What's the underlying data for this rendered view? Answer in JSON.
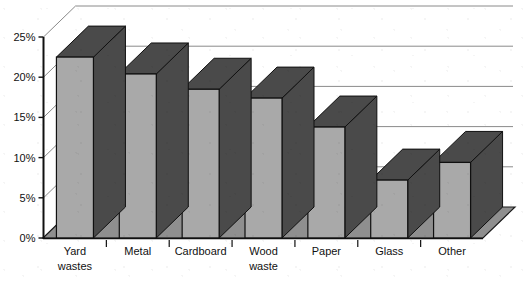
{
  "chart_data": {
    "type": "bar",
    "title": "",
    "subtitle": "",
    "xlabel": "",
    "ylabel": "",
    "categories": [
      "Yard wastes",
      "Metal",
      "Cardboard",
      "Wood waste",
      "Paper",
      "Glass",
      "Other"
    ],
    "values": [
      22.5,
      20.4,
      18.5,
      17.4,
      13.8,
      7.2,
      9.4
    ],
    "ylim": [
      0,
      25
    ],
    "y_ticks": [
      0,
      5,
      10,
      15,
      20,
      25
    ],
    "y_tick_labels": [
      "0%",
      "5%",
      "10%",
      "15%",
      "20%",
      "25%"
    ],
    "grid": true,
    "legend": "none",
    "style": "3d-column",
    "colors": {
      "bar_front": "#a9a9a9",
      "bar_side": "#4a4a4a",
      "bar_top": "#4a4a4a",
      "bar_outline": "#101010",
      "floor": "#8f8f8f",
      "floor_outline": "#1a1a1a",
      "gridline": "#8a8a8a",
      "axis": "#101010",
      "background": "#ffffff",
      "text": "#111111"
    }
  },
  "axis": {
    "y_labels": [
      "25%",
      "20%",
      "15%",
      "10%",
      "5%",
      "0%"
    ]
  },
  "categories_labels": [
    {
      "line1": "Yard",
      "line2": "wastes"
    },
    {
      "line1": "Metal",
      "line2": ""
    },
    {
      "line1": "Cardboard",
      "line2": ""
    },
    {
      "line1": "Wood",
      "line2": "waste"
    },
    {
      "line1": "Paper",
      "line2": ""
    },
    {
      "line1": "Glass",
      "line2": ""
    },
    {
      "line1": "Other",
      "line2": ""
    }
  ]
}
